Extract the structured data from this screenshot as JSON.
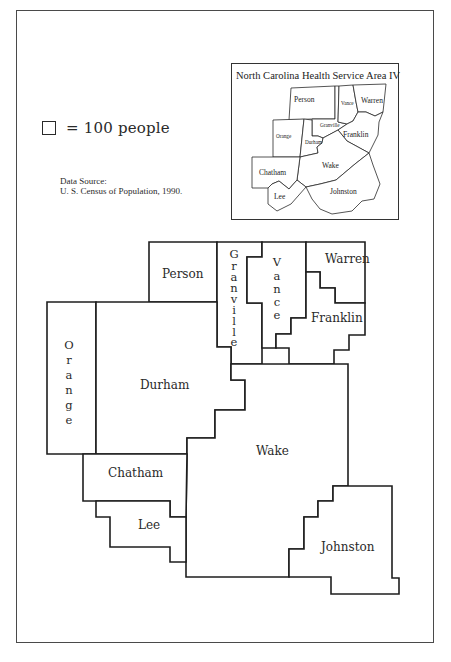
{
  "legend": {
    "symbol": "square-icon",
    "text": "= 100 people"
  },
  "source": {
    "line1": "Data Source:",
    "line2": "U. S. Census of Population, 1990."
  },
  "inset": {
    "title": "North Carolina Health Service Area IV",
    "counties": {
      "person": "Person",
      "vance": "Vance",
      "warren": "Warren",
      "granville": "Granville",
      "orange": "Orange",
      "durham": "Durham",
      "franklin": "Franklin",
      "chatham": "Chatham",
      "wake": "Wake",
      "lee": "Lee",
      "johnston": "Johnston"
    }
  },
  "cartogram": {
    "unit": "1 square = 100 people",
    "counties": {
      "person": "Person",
      "granville": [
        "G",
        "r",
        "a",
        "n",
        "v",
        "i",
        "l",
        "l",
        "e"
      ],
      "vance": [
        "V",
        "a",
        "n",
        "c",
        "e"
      ],
      "warren": "Warren",
      "franklin": "Franklin",
      "orange": [
        "O",
        "r",
        "a",
        "n",
        "g",
        "e"
      ],
      "durham": "Durham",
      "wake": "Wake",
      "chatham": "Chatham",
      "lee": "Lee",
      "johnston": "Johnston"
    }
  },
  "colors": {
    "ink": "#1e1e1e",
    "paper": "#ffffff"
  }
}
